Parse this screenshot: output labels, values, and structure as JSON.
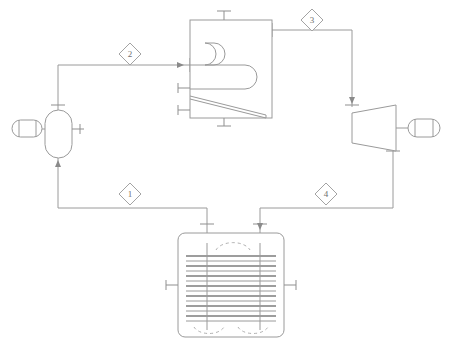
{
  "diagram": {
    "type": "process-flow-diagram",
    "canvas": {
      "width": 456,
      "height": 347
    },
    "colors": {
      "line": "#9a9a9a",
      "tube": "#7d7d7d",
      "dashed": "#b0b0b0",
      "text": "#6f6f6f",
      "background": "#ffffff"
    }
  },
  "stream_tags": [
    {
      "id": "tag-1",
      "label": "1",
      "x": 130,
      "y": 194,
      "description": "pump inlet / condenser outlet"
    },
    {
      "id": "tag-2",
      "label": "2",
      "x": 130,
      "y": 54,
      "description": "pump outlet / boiler inlet"
    },
    {
      "id": "tag-3",
      "label": "3",
      "x": 312,
      "y": 20,
      "description": "boiler outlet / turbine inlet"
    },
    {
      "id": "tag-4",
      "label": "4",
      "x": 326,
      "y": 194,
      "description": "turbine exhaust / condenser inlet"
    }
  ],
  "equipment": [
    {
      "id": "pump",
      "name": "pump",
      "shape": "vertical-capsule",
      "x": 45,
      "y": 110,
      "width": 27,
      "height": 48
    },
    {
      "id": "motor",
      "name": "pump-motor",
      "shape": "horizontal-capsule",
      "x": 12,
      "y": 120,
      "width": 30,
      "height": 17
    },
    {
      "id": "boiler",
      "name": "boiler",
      "shape": "rectangle-with-coil",
      "x": 190,
      "y": 20,
      "width": 82,
      "height": 98
    },
    {
      "id": "turbine",
      "name": "turbine",
      "shape": "trapezoid",
      "x": 352,
      "y": 105,
      "width": 44,
      "height": 46
    },
    {
      "id": "generator",
      "name": "generator",
      "shape": "horizontal-capsule",
      "x": 408,
      "y": 119,
      "width": 32,
      "height": 18
    },
    {
      "id": "condenser",
      "name": "condenser",
      "shape": "rounded-square-tube-bundle",
      "x": 178,
      "y": 233,
      "width": 106,
      "height": 104
    }
  ],
  "streams": [
    {
      "id": "stream-1",
      "name": "condensate-line",
      "from": "condenser",
      "to": "pump",
      "tag": "1"
    },
    {
      "id": "stream-2",
      "name": "feedwater-line",
      "from": "pump",
      "to": "boiler",
      "tag": "2"
    },
    {
      "id": "stream-3",
      "name": "steam-line",
      "from": "boiler",
      "to": "turbine",
      "tag": "3"
    },
    {
      "id": "stream-4",
      "name": "exhaust-steam-line",
      "from": "turbine",
      "to": "condenser",
      "tag": "4"
    }
  ]
}
